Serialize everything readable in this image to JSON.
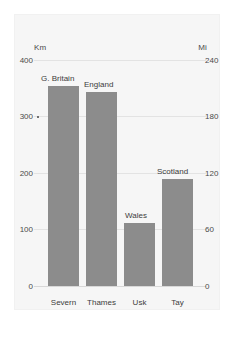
{
  "chart_data": {
    "type": "bar",
    "title": "",
    "subtitle": "",
    "categories": [
      "Severn",
      "Thames",
      "Usk",
      "Tay"
    ],
    "values": [
      354,
      343,
      111,
      189
    ],
    "annotations": [
      "G. Britain",
      "England",
      "Wales",
      "Scotland"
    ],
    "xlabel": "",
    "ylabel": "Km",
    "y2label": "Mi",
    "ylim": [
      0,
      400
    ],
    "y2lim": [
      0,
      240
    ],
    "yticks": [
      "400",
      "300",
      "200",
      "100",
      "0"
    ],
    "ytick_values": [
      400,
      300,
      200,
      100,
      0
    ],
    "y2ticks": [
      "240",
      "180",
      "120",
      "60",
      "0"
    ],
    "y2tick_values": [
      240,
      180,
      120,
      60,
      0
    ],
    "grid": true,
    "legend": "none",
    "bar_color": "#8c8c8c",
    "panel_color": "#f6f6f6",
    "grid_color": "#e3e3e3",
    "text_color": "#3c3c3c"
  },
  "axes": {
    "left_unit": "Km",
    "right_unit": "Mi"
  }
}
